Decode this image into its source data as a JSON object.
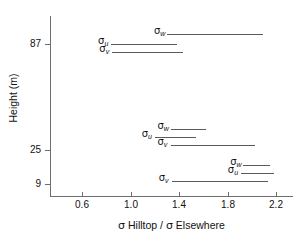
{
  "chart_data": {
    "type": "line",
    "title": "",
    "xlabel": "σ Hilltop / σ Elsewhere",
    "ylabel": "Height (m)",
    "xlim": [
      0.44,
      2.42
    ],
    "ylim_categories": [
      "9",
      "25",
      "87"
    ],
    "xticks": [
      "0.6",
      "1.0",
      "1.4",
      "1.8",
      "2.2"
    ],
    "xtick_values": [
      0.6,
      1.0,
      1.4,
      1.8,
      2.2
    ],
    "yticks": [
      "87",
      "25",
      "9"
    ],
    "ytick_values": [
      87,
      25,
      9
    ],
    "grid": false,
    "legend": "none",
    "series": [
      {
        "name": "σw at 87 m",
        "label_sigma": "σ",
        "label_sub": "w",
        "height_m": 87,
        "x_start": 1.3,
        "x_end": 2.09
      },
      {
        "name": "σu at 87 m",
        "label_sigma": "σ",
        "label_sub": "u",
        "height_m": 87,
        "x_start": 0.84,
        "x_end": 1.38
      },
      {
        "name": "σv at 87 m",
        "label_sigma": "σ",
        "label_sub": "v",
        "height_m": 87,
        "x_start": 0.85,
        "x_end": 1.43
      },
      {
        "name": "σw at 25 m",
        "label_sigma": "σ",
        "label_sub": "w",
        "height_m": 25,
        "x_start": 1.33,
        "x_end": 1.62
      },
      {
        "name": "σu at 25 m",
        "label_sigma": "σ",
        "label_sub": "u",
        "height_m": 25,
        "x_start": 1.2,
        "x_end": 1.54
      },
      {
        "name": "σv at 25 m",
        "label_sigma": "σ",
        "label_sub": "v",
        "height_m": 25,
        "x_start": 1.33,
        "x_end": 2.03
      },
      {
        "name": "σw at 9 m",
        "label_sigma": "σ",
        "label_sub": "w",
        "height_m": 9,
        "x_start": 1.93,
        "x_end": 2.15
      },
      {
        "name": "σu at 9 m",
        "label_sigma": "σ",
        "label_sub": "u",
        "height_m": 9,
        "x_start": 1.91,
        "x_end": 2.18
      },
      {
        "name": "σv at 9 m",
        "label_sigma": "σ",
        "label_sub": "v",
        "height_m": 9,
        "x_start": 1.34,
        "x_end": 2.13
      }
    ]
  },
  "axes": {
    "x_title_sigma": "σ",
    "x_title_part1": " Hilltop",
    "x_title_slash": " / ",
    "x_title_sigma2": "σ",
    "x_title_part2": " Elsewhere",
    "y_title": "Height (m)",
    "xticks": [
      "0.6",
      "1.0",
      "1.4",
      "1.8",
      "2.2"
    ],
    "yticks": [
      "87",
      "25",
      "9"
    ]
  },
  "colors": {
    "axis": "#6e6e6e",
    "line": "#5a5a5a",
    "text": "#111111",
    "background": "#ffffff"
  }
}
